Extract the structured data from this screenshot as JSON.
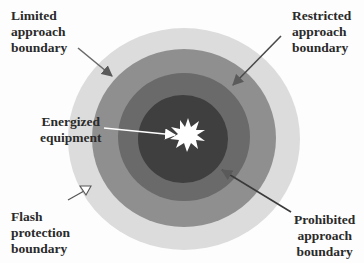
{
  "diagram": {
    "colors": {
      "background": "#fdfdfd",
      "flash_ring": "#dcdcdc",
      "limited_ring": "#8f8f8f",
      "restricted_ring": "#6a6a6a",
      "prohibited_core": "#3f3f3f",
      "starburst": "#ffffff",
      "arrow": "#5a5a5a",
      "text": "#2a2a2a"
    },
    "labels": {
      "limited": [
        "Limited",
        "approach",
        "boundary"
      ],
      "restricted": [
        "Restricted",
        "approach",
        "boundary"
      ],
      "energized": [
        "Energized",
        "equipment"
      ],
      "flash": [
        "Flash",
        "protection",
        "boundary"
      ],
      "prohibited": [
        "Prohibited",
        "approach",
        "boundary"
      ]
    }
  }
}
